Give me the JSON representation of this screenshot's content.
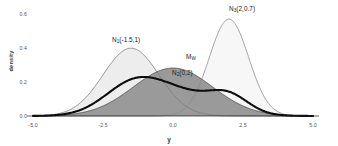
{
  "axes": {
    "x_title": "y",
    "y_title": "density",
    "x_ticks": [
      "-5.0",
      "-2.5",
      "0.0",
      "2.5",
      "5.0"
    ],
    "y_ticks": [
      "0.0",
      "0.2",
      "0.4",
      "0.6"
    ]
  },
  "annotations": {
    "n1": {
      "base": "N",
      "sub": "1",
      "args": "(-1.5,1)"
    },
    "n2": {
      "base": "N",
      "sub": "2",
      "args": "(0,2)"
    },
    "n3": {
      "base": "N",
      "sub": "3",
      "args": "(2,0.7)"
    },
    "mw": {
      "base": "M",
      "sub": "W",
      "args": ""
    }
  },
  "colors": {
    "background": "#ffffff",
    "n1_fill": "#ededed",
    "n1_stroke": "#7a7a7a",
    "n2_fill": "#9a9a9a",
    "n2_stroke": "#4a4a4a",
    "n3_fill": "#f7f7f7",
    "n3_stroke": "#8a8a8a",
    "mixture_stroke": "#0d0d0d",
    "axis_text": "#555555"
  },
  "chart_data": {
    "type": "line",
    "title": "",
    "xlabel": "y",
    "ylabel": "density",
    "xlim": [
      -5.0,
      5.0
    ],
    "ylim": [
      0.0,
      0.62
    ],
    "grid": false,
    "legend": "none",
    "x_ticks": [
      -5.0,
      -2.5,
      0.0,
      2.5,
      5.0
    ],
    "y_ticks": [
      0.0,
      0.2,
      0.4,
      0.6
    ],
    "series": [
      {
        "name": "N1(-1.5,1)",
        "label": "N₁(-1.5,1)",
        "kind": "normal_density",
        "mean": -1.5,
        "variance": 1,
        "sd": 1,
        "peak_density": 0.399,
        "filled": true,
        "fill": "#ededed",
        "stroke": "#7a7a7a",
        "stroke_width": 0.8
      },
      {
        "name": "N2(0,2)",
        "label": "N₂(0,2)",
        "kind": "normal_density",
        "mean": 0,
        "variance": 2,
        "sd": 1.4142,
        "peak_density": 0.282,
        "filled": true,
        "fill": "#9a9a9a",
        "stroke": "#4a4a4a",
        "stroke_width": 0.8
      },
      {
        "name": "N3(2,0.7)",
        "label": "N₃(2,0.7)",
        "kind": "normal_density",
        "mean": 2,
        "variance": 0.49,
        "sd": 0.7,
        "peak_density": 0.57,
        "filled": true,
        "fill": "#f7f7f7",
        "stroke": "#8a8a8a",
        "stroke_width": 0.8
      },
      {
        "name": "MW",
        "label": "M_W",
        "kind": "mixture_density",
        "components": [
          {
            "mean": -1.5,
            "sd": 1,
            "weight": 0.34
          },
          {
            "mean": 0,
            "sd": 1.4142,
            "weight": 0.5
          },
          {
            "mean": 2,
            "sd": 0.7,
            "weight": 0.16
          }
        ],
        "peak_density": 0.31,
        "peak_x": 0.15,
        "filled": false,
        "stroke": "#0d0d0d",
        "stroke_width": 2.1
      }
    ]
  }
}
